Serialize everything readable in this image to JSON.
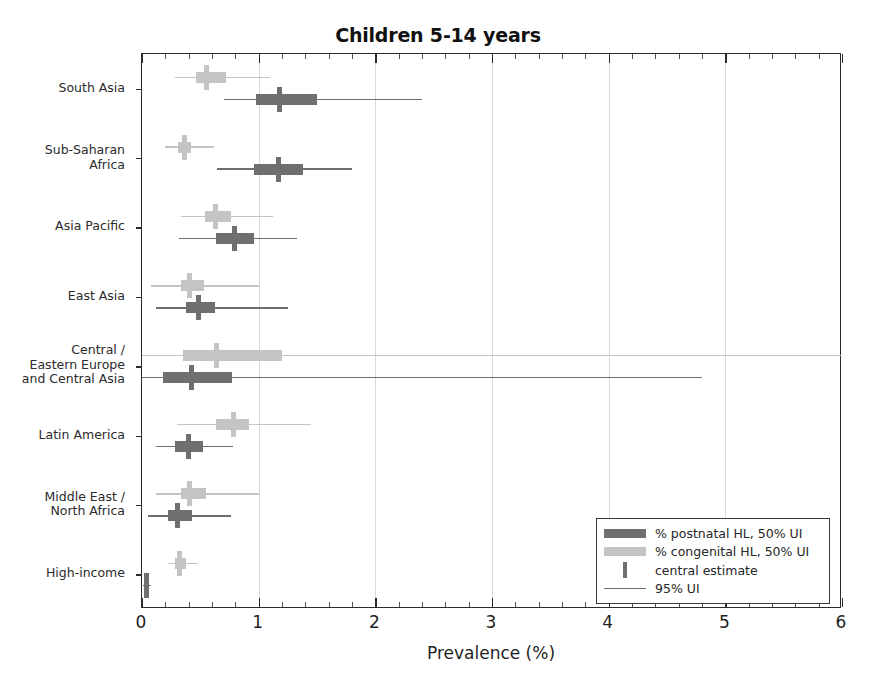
{
  "chart_data": {
    "type": "bar",
    "title": "Children 5-14 years",
    "xlabel": "Prevalence (%)",
    "ylabel": "",
    "xlim": [
      0,
      6
    ],
    "xticks": [
      0,
      1,
      2,
      3,
      4,
      5,
      6
    ],
    "xticklabels": [
      "0",
      "1",
      "2",
      "3",
      "4",
      "5",
      "6"
    ],
    "grid": "vertical-major",
    "legend_position": "lower-right",
    "colors": {
      "postnatal": "#6f6f6f",
      "congenital": "#c4c4c4",
      "axis": "#2b2b2b",
      "grid": "#d8d8d8"
    },
    "categories": [
      "South Asia",
      "Sub-Saharan\nAfrica",
      "Asia Pacific",
      "East Asia",
      "Central /\nEastern Europe\nand Central Asia",
      "Latin America",
      "Middle East /\nNorth Africa",
      "High-income"
    ],
    "series": [
      {
        "name": "% congenital HL, 50% UI",
        "color": "#c4c4c4",
        "points": [
          {
            "category": "South Asia",
            "central": 0.55,
            "ui50": [
              0.46,
              0.72
            ],
            "ui95": [
              0.28,
              1.1
            ]
          },
          {
            "category": "Sub-Saharan Africa",
            "central": 0.36,
            "ui50": [
              0.31,
              0.42
            ],
            "ui95": [
              0.2,
              0.62
            ]
          },
          {
            "category": "Asia Pacific",
            "central": 0.63,
            "ui50": [
              0.54,
              0.76
            ],
            "ui95": [
              0.33,
              1.12
            ]
          },
          {
            "category": "East Asia",
            "central": 0.41,
            "ui50": [
              0.33,
              0.53
            ],
            "ui95": [
              0.08,
              1.0
            ]
          },
          {
            "category": "Central / Eastern Europe and Central Asia",
            "central": 0.64,
            "ui50": [
              0.35,
              1.2
            ],
            "ui95": [
              0.0,
              6.0
            ]
          },
          {
            "category": "Latin America",
            "central": 0.78,
            "ui50": [
              0.63,
              0.92
            ],
            "ui95": [
              0.3,
              1.45
            ]
          },
          {
            "category": "Middle East / North Africa",
            "central": 0.41,
            "ui50": [
              0.33,
              0.55
            ],
            "ui95": [
              0.12,
              1.0
            ]
          },
          {
            "category": "High-income",
            "central": 0.32,
            "ui50": [
              0.28,
              0.38
            ],
            "ui95": [
              0.22,
              0.48
            ]
          }
        ]
      },
      {
        "name": "% postnatal HL, 50% UI",
        "color": "#6f6f6f",
        "points": [
          {
            "category": "South Asia",
            "central": 1.18,
            "ui50": [
              0.98,
              1.5
            ],
            "ui95": [
              0.7,
              2.4
            ]
          },
          {
            "category": "Sub-Saharan Africa",
            "central": 1.17,
            "ui50": [
              0.96,
              1.38
            ],
            "ui95": [
              0.64,
              1.8
            ]
          },
          {
            "category": "Asia Pacific",
            "central": 0.79,
            "ui50": [
              0.63,
              0.96
            ],
            "ui95": [
              0.32,
              1.33
            ]
          },
          {
            "category": "East Asia",
            "central": 0.48,
            "ui50": [
              0.38,
              0.63
            ],
            "ui95": [
              0.12,
              1.25
            ]
          },
          {
            "category": "Central / Eastern Europe and Central Asia",
            "central": 0.42,
            "ui50": [
              0.18,
              0.77
            ],
            "ui95": [
              0.0,
              4.8
            ]
          },
          {
            "category": "Latin America",
            "central": 0.4,
            "ui50": [
              0.28,
              0.52
            ],
            "ui95": [
              0.12,
              0.78
            ]
          },
          {
            "category": "Middle East / North Africa",
            "central": 0.3,
            "ui50": [
              0.22,
              0.43
            ],
            "ui95": [
              0.05,
              0.76
            ]
          },
          {
            "category": "High-income",
            "central": 0.04,
            "ui50": [
              0.02,
              0.06
            ],
            "ui95": [
              0.01,
              0.08
            ]
          }
        ]
      }
    ],
    "legend_entries": [
      {
        "label": "% postnatal HL, 50% UI",
        "swatch": "bar",
        "color": "#6f6f6f"
      },
      {
        "label": "% congenital HL, 50% UI",
        "swatch": "bar",
        "color": "#c4c4c4"
      },
      {
        "label": "central estimate",
        "swatch": "tick",
        "color": "#6f6f6f"
      },
      {
        "label": "95% UI",
        "swatch": "line",
        "color": "#6f6f6f"
      }
    ]
  }
}
